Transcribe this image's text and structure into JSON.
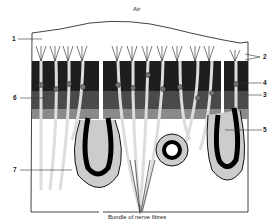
{
  "diagram": {
    "title_top": "Air",
    "title_bottom": "Bundle of nerve fibres",
    "labels": [
      {
        "id": "1",
        "text": "1",
        "side": "left",
        "y": 39
      },
      {
        "id": "2",
        "text": "2",
        "side": "right",
        "y": 57
      },
      {
        "id": "3",
        "text": "3",
        "side": "right",
        "y": 95
      },
      {
        "id": "4",
        "text": "4",
        "side": "right",
        "y": 83
      },
      {
        "id": "5",
        "text": "5",
        "side": "right",
        "y": 130
      },
      {
        "id": "6",
        "text": "6",
        "side": "left",
        "y": 98
      },
      {
        "id": "7",
        "text": "7",
        "side": "left",
        "y": 170
      }
    ],
    "colors": {
      "outline": "#111111",
      "dark_cell": "#2a2a2a",
      "mid_cell": "#555555",
      "light_fill": "#e8e8e8",
      "background": "#ffffff"
    }
  }
}
